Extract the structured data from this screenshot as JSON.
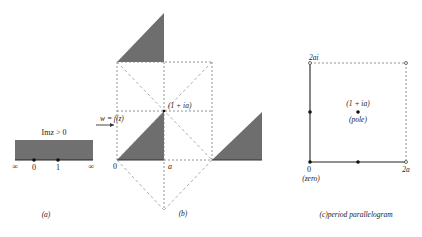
{
  "colors": {
    "shade": "#707070",
    "line": "#333333",
    "dash": "#777777",
    "dash_light": "#999999",
    "dot": "#111111"
  },
  "panel_a": {
    "region_label": "Imz > 0",
    "points": [
      "0",
      "1"
    ],
    "infinity_left": "∞",
    "infinity_right": "∞",
    "caption": "(a)"
  },
  "panel_b": {
    "map_label": "w = f(z)",
    "vertex_label": "(1 + ia)",
    "origin_label": "0",
    "a_label": "a",
    "caption": "(b)"
  },
  "panel_c": {
    "top_label": "2ai",
    "pole_coord": "(1 + ia)",
    "pole_label": "(pole)",
    "origin_label": "0",
    "zero_label": "(zero)",
    "right_label": "2a",
    "caption": "(c)period  parallelogram"
  }
}
